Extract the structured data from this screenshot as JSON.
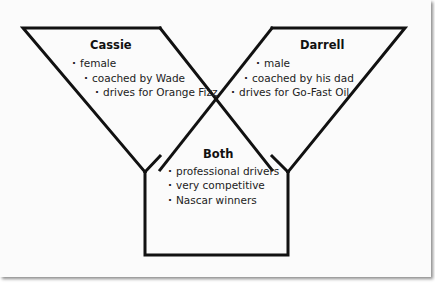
{
  "diagram": {
    "type": "venn-y-diagram",
    "left": {
      "title": "Cassie",
      "items": [
        "female",
        "coached by Wade",
        "drives for Orange Fizz"
      ]
    },
    "right": {
      "title": "Darrell",
      "items": [
        "male",
        "coached by his dad",
        "drives for Go-Fast Oil"
      ]
    },
    "both": {
      "title": "Both",
      "items": [
        "professional drivers",
        "very competitive",
        "Nascar winners"
      ]
    }
  },
  "colors": {
    "line": "#111111",
    "background": "#fbfbfb",
    "text": "#222222"
  }
}
